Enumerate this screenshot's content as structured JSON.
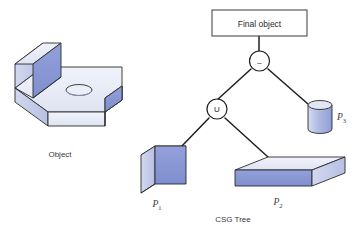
{
  "figure": {
    "title": "CSG Tree",
    "caption_tree": "CSG Tree",
    "caption_object": "Object",
    "background": "#ffffff"
  },
  "final_box": {
    "label": "Final object",
    "border_color": "#3a3a3a",
    "fill": "#ffffff"
  },
  "operators": [
    {
      "id": "subtract",
      "symbol": "–",
      "name": "difference-node"
    },
    {
      "id": "union",
      "symbol": "U",
      "name": "union-node"
    }
  ],
  "primitives": [
    {
      "id": "p1",
      "label": "P",
      "subscript": "1",
      "shape": "box-vertical-slab"
    },
    {
      "id": "p2",
      "label": "P",
      "subscript": "2",
      "shape": "box-horizontal-plate"
    },
    {
      "id": "p3",
      "label": "P",
      "subscript": "3",
      "shape": "cylinder"
    }
  ],
  "result_object": {
    "label": "Object",
    "shape": "l-bracket-with-hole"
  },
  "colors": {
    "face_front": "#8795d6",
    "face_front_dark": "#7b8ccd",
    "face_side_light": "#c3cbe8",
    "face_top_light": "#e4e8f4",
    "face_top_lighter": "#eef0f8",
    "outline": "#2b2b2b",
    "edge_thin": "#3a3a3a",
    "cylinder_body": "#a8b3e0",
    "text": "#3a3a3a",
    "line": "#1f1f1f"
  },
  "edges": [
    {
      "from": "final_box",
      "to": "subtract"
    },
    {
      "from": "subtract",
      "to": "union"
    },
    {
      "from": "subtract",
      "to": "p3"
    },
    {
      "from": "union",
      "to": "p1"
    },
    {
      "from": "union",
      "to": "p2"
    }
  ]
}
